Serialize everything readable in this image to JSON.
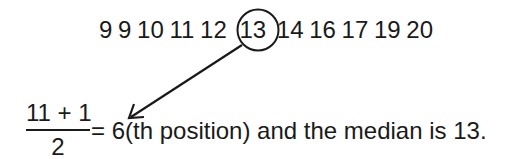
{
  "sequence": {
    "before": [
      "9",
      "9",
      "10",
      "11",
      "12"
    ],
    "median": "13",
    "after": [
      "14",
      "16",
      "17",
      "19",
      "20"
    ]
  },
  "formula": {
    "numerator": "11 + 1",
    "denominator": "2",
    "result": "= 6(th position) and the median is 13."
  }
}
